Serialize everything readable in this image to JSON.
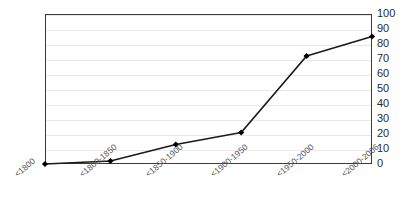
{
  "chart_data": {
    "type": "line",
    "title": "",
    "xlabel": "",
    "ylabel": "",
    "categories": [
      "<1800",
      "<1800-1850",
      "<1850-1900",
      "<1900-1950",
      "<1950-2000",
      "<2000-2006"
    ],
    "values": [
      0,
      2,
      13,
      21,
      72,
      85
    ],
    "series": [
      {
        "name": "",
        "values": [
          0,
          2,
          13,
          21,
          72,
          85
        ]
      }
    ],
    "ylim": [
      0,
      100
    ],
    "ytick_labels": [
      "0",
      "10",
      "20",
      "30",
      "40",
      "50",
      "60",
      "70",
      "80",
      "90",
      "100"
    ],
    "ytick_values": [
      0,
      10,
      20,
      30,
      40,
      50,
      60,
      70,
      80,
      90,
      100
    ],
    "y_axis_position": "right",
    "grid": "horizontal",
    "legend": "none",
    "marker": "diamond",
    "line_color": "#1a1a1a",
    "marker_color": "#000000",
    "grid_color": "#e9e9e9",
    "axis_color": "#3a3a3a",
    "tick_label_color": "#2b2b2b",
    "category_label_color": "#555555",
    "category_label_rotation": -40
  }
}
